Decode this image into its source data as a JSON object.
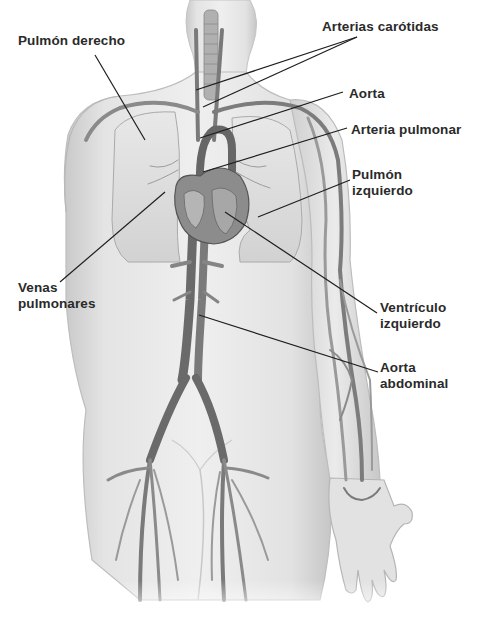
{
  "diagram": {
    "colors": {
      "background": "#ffffff",
      "skin": "#e6e6e6",
      "skin_shadow": "#c4c4c4",
      "vessel": "#6e6e6e",
      "vessel_light": "#9a9a9a",
      "lung": "#d9d9d9",
      "heart": "#8a8a8a",
      "label_text": "#2a2a2a",
      "leader_line": "#1e1e1e"
    },
    "labels": [
      {
        "id": "pulmon-derecho",
        "lines": [
          "Pulmón derecho"
        ],
        "x": 18,
        "y": 33,
        "pointers": [
          [
            95,
            55,
            145,
            140
          ]
        ]
      },
      {
        "id": "arterias-carotidas",
        "lines": [
          "Arterias carótidas"
        ],
        "x": 322,
        "y": 19,
        "pointers": [
          [
            357,
            37,
            196,
            90
          ],
          [
            357,
            37,
            203,
            107
          ]
        ]
      },
      {
        "id": "aorta",
        "lines": [
          "Aorta"
        ],
        "x": 349,
        "y": 86,
        "pointers": [
          [
            343,
            92,
            200,
            138
          ]
        ]
      },
      {
        "id": "arteria-pulmonar",
        "lines": [
          "Arteria pulmonar"
        ],
        "x": 351,
        "y": 122,
        "pointers": [
          [
            347,
            128,
            203,
            172
          ]
        ]
      },
      {
        "id": "pulmon-izquierdo",
        "lines": [
          "Pulmón",
          "izquierdo"
        ],
        "x": 352,
        "y": 167,
        "pointers": [
          [
            350,
            180,
            258,
            217
          ]
        ]
      },
      {
        "id": "venas-pulmonares",
        "lines": [
          "Venas",
          "pulmonares"
        ],
        "x": 18,
        "y": 280,
        "pointers": [
          [
            60,
            282,
            165,
            192
          ]
        ]
      },
      {
        "id": "ventriculo-izquierdo",
        "lines": [
          "Ventrículo",
          "izquierdo"
        ],
        "x": 380,
        "y": 300,
        "pointers": [
          [
            377,
            313,
            225,
            212
          ]
        ]
      },
      {
        "id": "aorta-abdominal",
        "lines": [
          "Aorta",
          "abdominal"
        ],
        "x": 380,
        "y": 360,
        "pointers": [
          [
            378,
            372,
            199,
            315
          ]
        ]
      }
    ]
  }
}
